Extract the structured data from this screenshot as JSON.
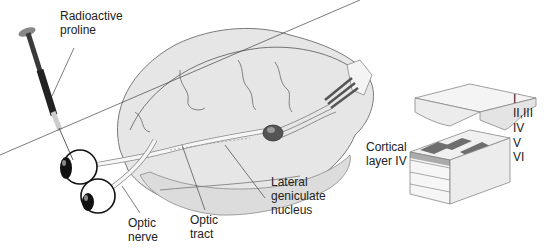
{
  "figure": {
    "colors": {
      "brain_fill": "#e6e6e6",
      "brain_stroke": "#7a7a7a",
      "syringe_dark": "#3a3a3a",
      "column_dark": "#6e6e6e",
      "layer_fill": "#f2f2f2",
      "text": "#222222"
    }
  },
  "labels": {
    "radioactive_proline": "Radioactive\nproline",
    "optic_nerve": "Optic\nnerve",
    "optic_tract": "Optic\ntract",
    "lgn": "Lateral\ngeniculate\nnucleus",
    "cortical_layer": "Cortical\nlayer IV"
  },
  "cortex_layers": [
    {
      "name": "I"
    },
    {
      "name": "II,III"
    },
    {
      "name": "IV"
    },
    {
      "name": "V"
    },
    {
      "name": "VI"
    }
  ]
}
